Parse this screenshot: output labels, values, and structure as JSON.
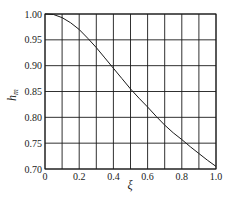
{
  "chart_data": {
    "type": "line",
    "title": "",
    "xlabel": "ξ",
    "ylabel": "h",
    "ylabel_subscript": "m",
    "xlim": [
      0,
      1.0
    ],
    "ylim": [
      0.7,
      1.0
    ],
    "grid": true,
    "x_ticks": [
      0,
      0.1,
      0.2,
      0.3,
      0.4,
      0.5,
      0.6,
      0.7,
      0.8,
      0.9,
      1.0
    ],
    "x_tick_labels": [
      "0",
      "0.2",
      "0.4",
      "0.6",
      "0.8",
      "1.0"
    ],
    "x_tick_label_values": [
      0,
      0.2,
      0.4,
      0.6,
      0.8,
      1.0
    ],
    "y_ticks": [
      0.7,
      0.75,
      0.8,
      0.85,
      0.9,
      0.95,
      1.0
    ],
    "y_tick_labels": [
      "0.70",
      "0.75",
      "0.80",
      "0.85",
      "0.90",
      "0.95",
      "1.00"
    ],
    "series": [
      {
        "name": "h_m",
        "x": [
          0,
          0.05,
          0.1,
          0.15,
          0.2,
          0.25,
          0.3,
          0.35,
          0.4,
          0.45,
          0.5,
          0.55,
          0.6,
          0.65,
          0.7,
          0.75,
          0.8,
          0.85,
          0.9,
          0.95,
          1.0
        ],
        "values": [
          1.0,
          0.999,
          0.993,
          0.983,
          0.97,
          0.953,
          0.935,
          0.915,
          0.895,
          0.875,
          0.855,
          0.837,
          0.82,
          0.802,
          0.785,
          0.77,
          0.757,
          0.743,
          0.73,
          0.717,
          0.705
        ]
      }
    ]
  }
}
